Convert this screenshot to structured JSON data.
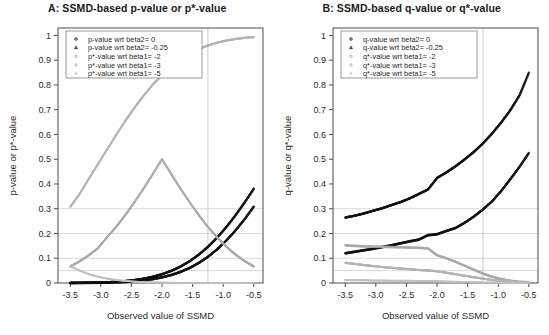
{
  "figure": {
    "width": 549,
    "height": 335,
    "background": "#ffffff"
  },
  "panels": [
    {
      "id": "panel-a",
      "title": "A: SSMD-based p-value or p*-value",
      "xlabel": "Observed value of SSMD",
      "ylabel": "p-value or p*-value",
      "legend": [
        {
          "marker": "circle",
          "color": "#111111",
          "label": "p-value  wrt beta2= 0"
        },
        {
          "marker": "triangle",
          "color": "#111111",
          "label": "p-value  wrt beta2= -0.25"
        },
        {
          "marker": "circle",
          "color": "#a8a8a8",
          "label": "p*-value wrt beta1= -2"
        },
        {
          "marker": "triangle",
          "color": "#b4b4b4",
          "label": "p*-value wrt beta1= -3"
        },
        {
          "marker": "plus",
          "color": "#c0c0c0",
          "label": "p*-value wrt beta1= -5"
        }
      ]
    },
    {
      "id": "panel-b",
      "title": "B: SSMD-based q-value or q*-value",
      "xlabel": "Observed value of SSMD",
      "ylabel": "q-value or q*-value",
      "legend": [
        {
          "marker": "circle",
          "color": "#111111",
          "label": "q-value  wrt beta2= 0"
        },
        {
          "marker": "triangle",
          "color": "#111111",
          "label": "q-value  wrt beta2= -0.25"
        },
        {
          "marker": "circle",
          "color": "#a8a8a8",
          "label": "q*-value wrt beta1= -2"
        },
        {
          "marker": "triangle",
          "color": "#b4b4b4",
          "label": "q*-value wrt beta1= -3"
        },
        {
          "marker": "plus",
          "color": "#c0c0c0",
          "label": "q*-value wrt beta1= -5"
        }
      ]
    }
  ],
  "chart_data": [
    {
      "type": "scatter",
      "panel": "A",
      "title": "A: SSMD-based p-value or p*-value",
      "xlabel": "Observed value of SSMD",
      "ylabel": "p-value or p*-value",
      "xlim": [
        -3.7,
        -0.35
      ],
      "ylim": [
        0,
        1.03
      ],
      "xticks": [
        -3.5,
        -3.0,
        -2.5,
        -2.0,
        -1.5,
        -1.0,
        -0.5
      ],
      "yticks": [
        0,
        0.1,
        0.2,
        0.3,
        0.4,
        0.5,
        0.6,
        0.7,
        0.8,
        0.9,
        1
      ],
      "grid": true,
      "hlines": [
        0.05,
        0.1,
        0.2,
        0.3
      ],
      "vlines": [
        -1.25
      ],
      "legend_position": "top-left",
      "x": [
        -3.5,
        -3.35,
        -3.2,
        -3.05,
        -2.9,
        -2.75,
        -2.6,
        -2.45,
        -2.3,
        -2.15,
        -2.0,
        -1.85,
        -1.7,
        -1.55,
        -1.4,
        -1.25,
        -1.1,
        -0.95,
        -0.8,
        -0.65,
        -0.5
      ],
      "series": [
        {
          "name": "p-value  wrt beta2= 0",
          "marker": "circle",
          "color": "#111111",
          "values": [
            0.0002,
            0.0004,
            0.0007,
            0.0011,
            0.0019,
            0.003,
            0.0047,
            0.0071,
            0.0107,
            0.0158,
            0.0228,
            0.0322,
            0.0446,
            0.0606,
            0.0808,
            0.1056,
            0.1357,
            0.1711,
            0.2119,
            0.2578,
            0.3085
          ]
        },
        {
          "name": "p-value  wrt beta2= -0.25",
          "marker": "triangle",
          "color": "#111111",
          "values": [
            0.0005,
            0.0008,
            0.0013,
            0.0021,
            0.0035,
            0.0054,
            0.0082,
            0.0122,
            0.0179,
            0.0256,
            0.0359,
            0.0495,
            0.0668,
            0.0885,
            0.1151,
            0.1469,
            0.1841,
            0.2266,
            0.2743,
            0.3264,
            0.3821
          ]
        },
        {
          "name": "p*-value wrt beta1= -2",
          "marker": "circle",
          "color": "#a8a8a8",
          "values": [
            0.0668,
            0.0869,
            0.1112,
            0.1401,
            0.1841,
            0.2266,
            0.2743,
            0.3264,
            0.3821,
            0.4404,
            0.5,
            0.4404,
            0.3821,
            0.3264,
            0.2743,
            0.2266,
            0.1841,
            0.1469,
            0.1151,
            0.0885,
            0.0668
          ]
        },
        {
          "name": "p*-value wrt beta1= -3",
          "marker": "triangle",
          "color": "#b4b4b4",
          "values": [
            0.3085,
            0.3594,
            0.4207,
            0.4801,
            0.5398,
            0.5987,
            0.6554,
            0.7088,
            0.758,
            0.8023,
            0.8413,
            0.8749,
            0.9032,
            0.9265,
            0.9452,
            0.9599,
            0.9713,
            0.9798,
            0.9861,
            0.9906,
            0.9938
          ]
        },
        {
          "name": "p*-value wrt beta1= -5",
          "marker": "plus",
          "color": "#c0c0c0",
          "values": [
            0.0668,
            0.0505,
            0.0359,
            0.0256,
            0.0179,
            0.0122,
            0.0082,
            0.0054,
            0.0035,
            0.0022,
            0.0013,
            0.0008,
            0.0005,
            0.0003,
            0.0002,
            0.0001,
            6e-05,
            3e-05,
            2e-05,
            1e-05,
            5e-06
          ]
        }
      ],
      "notes": "p*-value wrt beta1=-3 curve descends from ~0.73 at left edge; p*-value wrt beta1=-2 descends from ~0.50; both decline across the range. Black p-value curves rise steeply toward the right, reaching ~0.47 and ~0.29 at x=-0.5."
    },
    {
      "type": "scatter",
      "panel": "B",
      "title": "B: SSMD-based q-value or q*-value",
      "xlabel": "Observed value of SSMD",
      "ylabel": "q-value or q*-value",
      "xlim": [
        -3.7,
        -0.35
      ],
      "ylim": [
        0,
        1.03
      ],
      "xticks": [
        -3.5,
        -3.0,
        -2.5,
        -2.0,
        -1.5,
        -1.0,
        -0.5
      ],
      "yticks": [
        0,
        0.1,
        0.2,
        0.3,
        0.4,
        0.5,
        0.6,
        0.7,
        0.8,
        0.9,
        1
      ],
      "grid": true,
      "hlines": [
        0.05,
        0.1,
        0.2,
        0.3
      ],
      "vlines": [
        -1.25
      ],
      "legend_position": "top-left",
      "x": [
        -3.5,
        -3.35,
        -3.2,
        -3.05,
        -2.9,
        -2.75,
        -2.6,
        -2.45,
        -2.3,
        -2.15,
        -2.0,
        -1.85,
        -1.7,
        -1.55,
        -1.4,
        -1.25,
        -1.1,
        -0.95,
        -0.8,
        -0.65,
        -0.5
      ],
      "series": [
        {
          "name": "q-value  wrt beta2= 0",
          "marker": "circle",
          "color": "#111111",
          "values": [
            0.12,
            0.126,
            0.132,
            0.138,
            0.145,
            0.152,
            0.16,
            0.168,
            0.175,
            0.193,
            0.197,
            0.21,
            0.222,
            0.243,
            0.268,
            0.297,
            0.33,
            0.372,
            0.42,
            0.47,
            0.525
          ]
        },
        {
          "name": "q-value  wrt beta2= -0.25",
          "marker": "triangle",
          "color": "#111111",
          "values": [
            0.265,
            0.272,
            0.281,
            0.292,
            0.302,
            0.315,
            0.327,
            0.342,
            0.36,
            0.378,
            0.425,
            0.447,
            0.472,
            0.5,
            0.53,
            0.565,
            0.605,
            0.65,
            0.7,
            0.76,
            0.85
          ]
        },
        {
          "name": "q*-value wrt beta1= -2",
          "marker": "circle",
          "color": "#a8a8a8",
          "values": [
            0.152,
            0.15,
            0.148,
            0.147,
            0.146,
            0.145,
            0.144,
            0.143,
            0.142,
            0.14,
            0.112,
            0.1,
            0.086,
            0.07,
            0.054,
            0.038,
            0.025,
            0.016,
            0.009,
            0.005,
            0.003
          ]
        },
        {
          "name": "q*-value wrt beta1= -3",
          "marker": "triangle",
          "color": "#b4b4b4",
          "values": [
            0.082,
            0.078,
            0.073,
            0.069,
            0.065,
            0.062,
            0.059,
            0.056,
            0.053,
            0.051,
            0.048,
            0.042,
            0.036,
            0.03,
            0.024,
            0.018,
            0.013,
            0.009,
            0.006,
            0.004,
            0.002
          ]
        },
        {
          "name": "q*-value wrt beta1= -5",
          "marker": "plus",
          "color": "#c0c0c0",
          "values": [
            0.012,
            0.011,
            0.011,
            0.01,
            0.01,
            0.009,
            0.009,
            0.009,
            0.008,
            0.008,
            0.007,
            0.006,
            0.005,
            0.004,
            0.003,
            0.002,
            0.002,
            0.001,
            0.001,
            0.0008,
            0.0005
          ]
        }
      ],
      "notes": "q-value curves rise monotonically left-to-right; upper black curve (beta2=-0.25) starts ~0.265 and reaches ~0.85; lower black curve (beta2=0) starts ~0.12 reaching ~0.525. Grey q*-value curves decline toward zero."
    }
  ]
}
